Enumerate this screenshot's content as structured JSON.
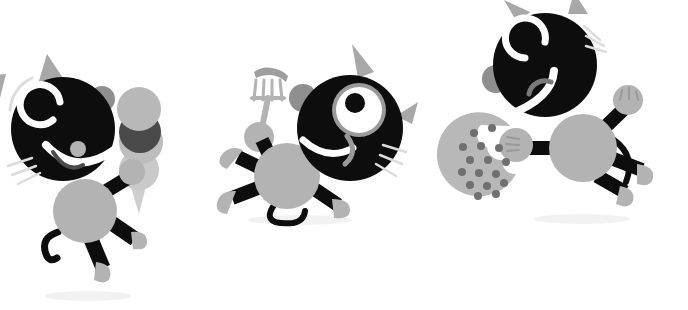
{
  "scene": {
    "title": "Three cartoon cat characters with snacks",
    "width": 688,
    "height": 310,
    "background_color": "#ffffff",
    "style": "flat vector cartoon illustration, grayscale palette",
    "shadow_color": "#f0f0f0",
    "motion_line_color": "#d8d8d8"
  },
  "palette": {
    "black": "#0d0d0d",
    "body_gray": "#b3b3b3",
    "ear_gray": "#a8a8a8",
    "dark_gray": "#4a4a4a",
    "light_gray": "#c4c4c4",
    "white": "#ffffff",
    "whisker_gray": "#dcdcdc",
    "chip_gray": "#707070",
    "shadow": "#f2f2f2"
  },
  "characters": [
    {
      "id": "cat-left",
      "name": "Cat with ice cream cone",
      "pose": "walking left, arm raised holding cone",
      "head": {
        "shape": "circle",
        "color": "#0d0d0d",
        "cx": 63,
        "cy": 129,
        "r": 52,
        "eye_style": "white-c-curve",
        "mouth_style": "wide-white-smile",
        "whiskers": 3,
        "ears": 2,
        "ear_color": "#a8a8a8"
      },
      "body": {
        "shape": "circle",
        "color": "#b3b3b3",
        "cx": 85,
        "cy": 211,
        "r": 32
      },
      "limbs": {
        "count": 3,
        "color": "#0d0d0d",
        "paw_color": "#b3b3b3",
        "tail": true
      },
      "item": {
        "name": "ice-cream-cone",
        "scoops": [
          {
            "color": "#b8b8b8",
            "label": "vanilla-top"
          },
          {
            "color": "#4a4a4a",
            "label": "chocolate-middle"
          },
          {
            "color": "#bdbdbd",
            "label": "vanilla-bottom"
          }
        ],
        "cone_color": "#cfcfcf"
      }
    },
    {
      "id": "cat-middle",
      "name": "Cat with sausage on fork",
      "pose": "leaning back, arm up holding fork",
      "head": {
        "shape": "circle",
        "color": "#0d0d0d",
        "cx": 350,
        "cy": 128,
        "r": 53,
        "eye_style": "big-open-eye",
        "mouth_style": "white-smile",
        "whiskers": 3,
        "ears": 2,
        "ear_color": "#a8a8a8"
      },
      "body": {
        "shape": "circle",
        "color": "#b3b3b3",
        "cx": 287,
        "cy": 175,
        "r": 33
      },
      "limbs": {
        "count": 4,
        "color": "#0d0d0d",
        "paw_color": "#b3b3b3",
        "tail": true
      },
      "item": {
        "name": "fork-with-sausage",
        "fork_color": "#b3b3b3",
        "sausage_color": "#9e9e9e",
        "tines": 4
      }
    },
    {
      "id": "cat-right",
      "name": "Cat with chocolate chip cookie",
      "pose": "leaping right, holding cookie",
      "head": {
        "shape": "circle",
        "color": "#0d0d0d",
        "cx": 545,
        "cy": 65,
        "r": 52,
        "eye_style": "white-c-curve",
        "mouth_style": "long-white-smile",
        "whiskers": 3,
        "ears": 2,
        "ear_color": "#a8a8a8"
      },
      "body": {
        "shape": "circle",
        "color": "#b3b3b3",
        "cx": 583,
        "cy": 148,
        "r": 34
      },
      "limbs": {
        "count": 4,
        "color": "#0d0d0d",
        "paw_color": "#b3b3b3",
        "tail": true
      },
      "item": {
        "name": "cookie-with-bite",
        "cookie_color": "#b8b8b8",
        "chip_color": "#707070",
        "chip_count": 16,
        "bite_taken": true
      }
    }
  ],
  "shadows": [
    {
      "cx": 88,
      "cy": 296,
      "rx": 44,
      "ry": 5
    },
    {
      "cx": 300,
      "cy": 220,
      "rx": 52,
      "ry": 5
    },
    {
      "cx": 580,
      "cy": 220,
      "rx": 48,
      "ry": 5
    }
  ]
}
